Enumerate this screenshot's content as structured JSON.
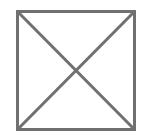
{
  "placeholder": {
    "type": "image-placeholder",
    "icon": "crossed-box-icon",
    "alt_text": "",
    "stroke_color": "#707070",
    "background_color": "#ffffff",
    "box": {
      "x": 17.5,
      "y": 11.5,
      "width": 117,
      "height": 118
    },
    "stroke_width": 3
  }
}
